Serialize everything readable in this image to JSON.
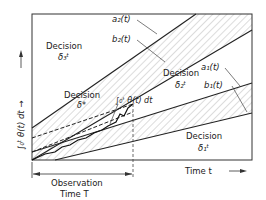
{
  "diagram": {
    "y_axis_label": "∫₀ᵗ θ(t) dt →",
    "x_axis_label": "Time  t",
    "observation_label_line1": "Observation",
    "observation_label_line2": "Time  T",
    "regions": {
      "d3": {
        "word": "Decision",
        "symbol": "δ₃ᵗ"
      },
      "d2": {
        "word": "Decision",
        "symbol": "δ₂ᵗ"
      },
      "d1": {
        "word": "Decision",
        "symbol": "δ₁ᵗ"
      },
      "dstar": {
        "word": "Decision",
        "symbol": "δ*"
      }
    },
    "curves": {
      "a2": "a₂(t)",
      "b2": "b₂(t)",
      "a1": "a₁(t)",
      "b1": "b₁(t)",
      "integral": "∫₀ᵗ θ(t) dt"
    },
    "colors": {
      "line": "#222222",
      "hatch": "#8a8a8a",
      "background": "#ffffff"
    }
  }
}
